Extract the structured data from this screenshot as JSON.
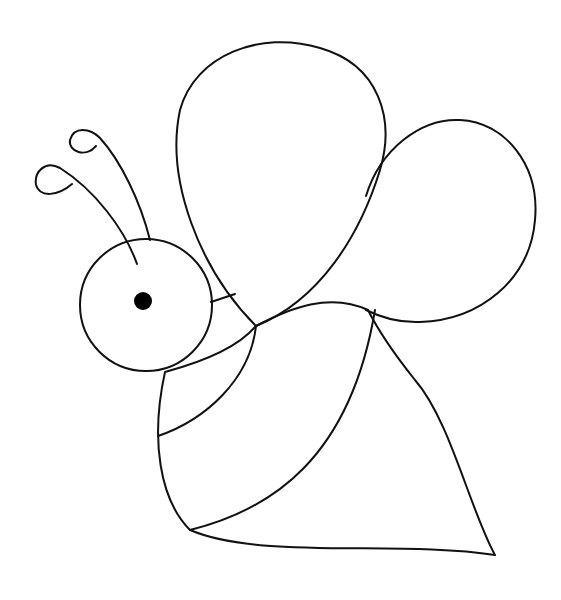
{
  "image": {
    "subject": "bee line drawing",
    "background": "#ffffff",
    "line_color": "#111111",
    "eye_color": "#000000"
  }
}
